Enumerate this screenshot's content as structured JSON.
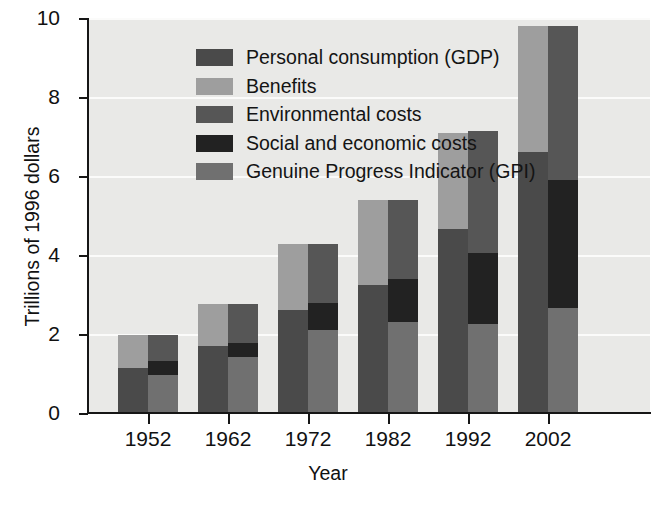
{
  "chart_data": {
    "type": "bar",
    "title": "",
    "xlabel": "Year",
    "ylabel": "Trillions of 1996 dollars",
    "categories": [
      "1952",
      "1962",
      "1972",
      "1982",
      "1992",
      "2002"
    ],
    "xtick_labels": [
      "1952",
      "1962",
      "1972",
      "1982",
      "1992",
      "2002"
    ],
    "ytick_labels": [
      "0",
      "2",
      "4",
      "6",
      "8",
      "10"
    ],
    "ytick_values": [
      0,
      2,
      4,
      6,
      8,
      10
    ],
    "ylim": [
      0,
      10
    ],
    "grid": true,
    "grid_axis": "y",
    "legend_position": "upper-left-inside",
    "bar_group_note": "Two stacked bars per year: left = GDP composition (Personal consumption + Benefits), right = GPI composition (GPI + Social and economic costs + Environmental costs)",
    "series": [
      {
        "name": "Personal consumption (GDP)",
        "color": "#4a4a4a",
        "stack": "left",
        "values": [
          1.15,
          1.7,
          2.6,
          3.25,
          4.65,
          6.6
        ]
      },
      {
        "name": "Benefits",
        "color": "#9e9e9e",
        "stack": "left",
        "values": [
          0.83,
          1.07,
          1.68,
          2.15,
          2.45,
          3.2
        ]
      },
      {
        "name": "Genuine Progress Indicator (GPI)",
        "color": "#707070",
        "stack": "right",
        "values": [
          0.96,
          1.42,
          2.1,
          2.3,
          2.25,
          2.65
        ]
      },
      {
        "name": "Social and economic costs",
        "color": "#222222",
        "stack": "right",
        "values": [
          0.36,
          0.35,
          0.68,
          1.1,
          1.8,
          3.25
        ]
      },
      {
        "name": "Environmental costs",
        "color": "#565656",
        "stack": "right",
        "values": [
          0.66,
          1.0,
          1.5,
          2.0,
          3.1,
          3.9
        ]
      }
    ],
    "totals": {
      "left_bar": [
        1.98,
        2.77,
        4.28,
        5.4,
        7.1,
        9.8
      ],
      "right_bar": [
        1.98,
        2.77,
        4.28,
        5.4,
        7.15,
        9.8
      ]
    }
  },
  "legend": {
    "items": [
      {
        "label": "Personal consumption (GDP)",
        "color": "#4a4a4a",
        "swatch_name": "legend-swatch-personal-consumption"
      },
      {
        "label": "Benefits",
        "color": "#9e9e9e",
        "swatch_name": "legend-swatch-benefits"
      },
      {
        "label": "Environmental costs",
        "color": "#565656",
        "swatch_name": "legend-swatch-environmental-costs"
      },
      {
        "label": "Social and economic costs",
        "color": "#222222",
        "swatch_name": "legend-swatch-social-economic-costs"
      },
      {
        "label": "Genuine Progress Indicator (GPI)",
        "color": "#707070",
        "swatch_name": "legend-swatch-gpi"
      }
    ]
  },
  "axes": {
    "y_title": "Trillions of 1996 dollars",
    "x_title": "Year"
  },
  "colors": {
    "plot_background": "#e9e9e7",
    "gridline": "#fbfbfa",
    "axis": "#161616",
    "text": "#111111"
  }
}
